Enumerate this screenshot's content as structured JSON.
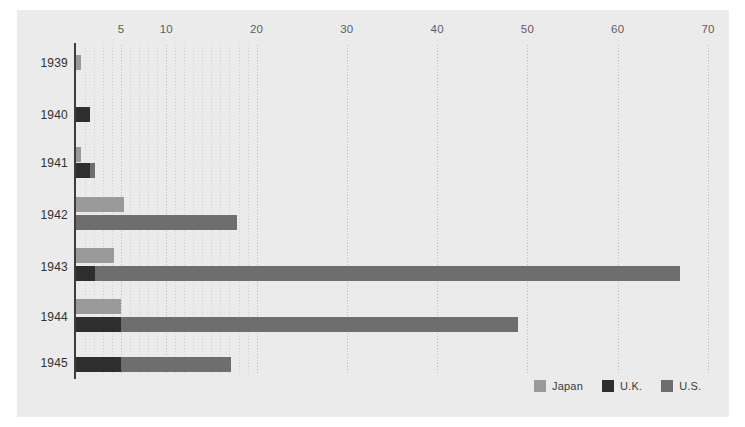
{
  "chart_data": {
    "type": "bar",
    "orientation": "horizontal",
    "stacked": true,
    "title": "",
    "subtitle": "",
    "xlabel": "",
    "ylabel": "",
    "xlim": [
      0,
      70
    ],
    "ylim": null,
    "grid": true,
    "grid_axis": "x",
    "grid_style": "dotted",
    "legend_position": "bottom-right",
    "xticks": [
      5,
      10,
      20,
      30,
      40,
      50,
      60,
      70
    ],
    "xtick_labels": [
      "5",
      "10",
      "20",
      "30",
      "40",
      "50",
      "60",
      "70"
    ],
    "minor_xticks": [
      1,
      2,
      3,
      4,
      6,
      7,
      8,
      9,
      11,
      12,
      13,
      14,
      15,
      16,
      17,
      18,
      19
    ],
    "categories": [
      "1939",
      "1940",
      "1941",
      "1942",
      "1943",
      "1944",
      "1945"
    ],
    "series": [
      {
        "name": "Japan",
        "color": "#9a9a9a",
        "values": [
          0.6,
          0.0,
          0.6,
          5.3,
          4.2,
          5.0,
          0.0
        ]
      },
      {
        "name": "U.K.",
        "color": "#2e2e2e",
        "values": [
          0.0,
          1.6,
          1.5,
          0.0,
          2.1,
          5.0,
          5.0
        ]
      },
      {
        "name": "U.S.",
        "color": "#6e6e6e",
        "values": [
          0.0,
          0.0,
          0.6,
          17.8,
          64.8,
          44.0,
          12.2
        ]
      }
    ]
  },
  "legend": {
    "items": [
      {
        "label": "Japan",
        "color": "#9a9a9a"
      },
      {
        "label": "U.K.",
        "color": "#2e2e2e"
      },
      {
        "label": "U.S.",
        "color": "#6e6e6e"
      }
    ]
  },
  "axis": {
    "x_tick_labels": [
      "5",
      "10",
      "20",
      "30",
      "40",
      "50",
      "60",
      "70"
    ],
    "y_tick_labels": [
      "1939",
      "1940",
      "1941",
      "1942",
      "1943",
      "1944",
      "1945"
    ]
  },
  "colors": {
    "background": "#ebebeb",
    "page": "#ffffff",
    "axis_line": "#3c3c3c",
    "gridline": "#c4c4c4",
    "tick_text": "#5d5d5d",
    "year_text": "#2f2f2f"
  },
  "bars": [
    {
      "year": "1939",
      "series": "Japan",
      "start": 0,
      "value": 0.6,
      "top": 10
    },
    {
      "year": "1940",
      "series": "U.K.",
      "start": 0,
      "value": 1.6,
      "top": 62
    },
    {
      "year": "1941",
      "series": "Japan",
      "start": 0,
      "value": 0.6,
      "top": 102
    },
    {
      "year": "1941",
      "series": "U.K.",
      "start": 0,
      "value": 1.5,
      "top": 118
    },
    {
      "year": "1941",
      "series": "U.S.",
      "start": 1.5,
      "value": 0.6,
      "top": 118
    },
    {
      "year": "1942",
      "series": "Japan",
      "start": 0,
      "value": 5.3,
      "top": 152
    },
    {
      "year": "1942",
      "series": "U.S.",
      "start": 0,
      "value": 17.8,
      "top": 170
    },
    {
      "year": "1943",
      "series": "Japan",
      "start": 0,
      "value": 4.2,
      "top": 203
    },
    {
      "year": "1943",
      "series": "U.K.",
      "start": 0,
      "value": 2.1,
      "top": 221
    },
    {
      "year": "1943",
      "series": "U.S.",
      "start": 2.1,
      "value": 64.8,
      "top": 221
    },
    {
      "year": "1944",
      "series": "Japan",
      "start": 0,
      "value": 5.0,
      "top": 254
    },
    {
      "year": "1944",
      "series": "U.K.",
      "start": 0,
      "value": 5.0,
      "top": 272
    },
    {
      "year": "1944",
      "series": "U.S.",
      "start": 5.0,
      "value": 44.0,
      "top": 272
    },
    {
      "year": "1945",
      "series": "U.K.",
      "start": 0,
      "value": 5.0,
      "top": 312
    },
    {
      "year": "1945",
      "series": "U.S.",
      "start": 5.0,
      "value": 12.2,
      "top": 312
    }
  ],
  "year_positions": [
    18,
    70,
    118,
    170,
    222,
    272,
    318
  ]
}
